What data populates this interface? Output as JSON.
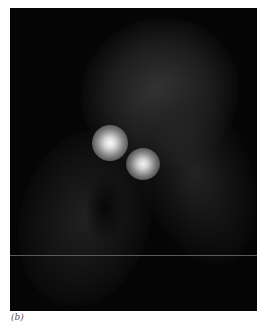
{
  "figure": {
    "panel_label": "(b)",
    "background_color": "#050505",
    "spot_color": "#f5f5f5"
  }
}
